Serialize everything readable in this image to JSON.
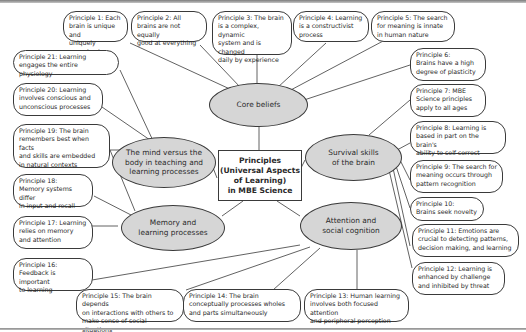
{
  "center": {
    "label": "Principles\n(Universal Aspects\nof Learning)\nin MBE Science"
  },
  "categories": [
    {
      "id": "core",
      "label": "Core beliefs"
    },
    {
      "id": "mind",
      "label": "The mind versus the\nbody in teaching and\nlearning processes"
    },
    {
      "id": "survival",
      "label": "Survival skills\nof the brain"
    },
    {
      "id": "memory",
      "label": "Memory and\nlearning processes"
    },
    {
      "id": "attention",
      "label": "Attention and\nsocial cognition"
    }
  ],
  "principles": [
    {
      "n": 1,
      "label": "Principle 1: Each\nbrain is unique and\nuniquely organized",
      "category": "core"
    },
    {
      "n": 2,
      "label": "Principle 2: All\nbrains are not equally\ngood at everything",
      "category": "core"
    },
    {
      "n": 3,
      "label": "Principle 3: The brain\nis a complex, dynamic\nsystem and is changed\ndaily by experience",
      "category": "core"
    },
    {
      "n": 4,
      "label": "Principle 4: Learning\nis a constructivist\nprocess",
      "category": "core"
    },
    {
      "n": 5,
      "label": "Principle 5: The search\nfor meaning is innate\nin human nature",
      "category": "core"
    },
    {
      "n": 6,
      "label": "Principle 6:\nBrains have a high\ndegree of plasticity",
      "category": "core"
    },
    {
      "n": 7,
      "label": "Principle 7: MBE\nScience principles\napply to all ages",
      "category": "survival"
    },
    {
      "n": 8,
      "label": "Principle 8: Learning is\nbased in part on the brain's\nability to self-correct",
      "category": "survival"
    },
    {
      "n": 9,
      "label": "Principle 9: The search for\nmeaning occurs through\npattern recognition",
      "category": "survival"
    },
    {
      "n": 10,
      "label": "Principle 10:\nBrains seek novelty",
      "category": "survival"
    },
    {
      "n": 11,
      "label": "Principle 11: Emotions are\ncrucial to detecting patterns,\ndecision making, and learning",
      "category": "survival"
    },
    {
      "n": 12,
      "label": "Principle 12: Learning is\nenhanced by challenge\nand inhibited by threat",
      "category": "survival"
    },
    {
      "n": 13,
      "label": "Principle 13: Human learning\ninvolves both focused attention\nand peripheral perception",
      "category": "attention"
    },
    {
      "n": 14,
      "label": "Principle 14: The brain\nconceptually processes wholes\nand parts simultaneously",
      "category": "attention"
    },
    {
      "n": 15,
      "label": "Principle 15: The brain depends\non interactions with others to\nmake sense of social situations",
      "category": "attention"
    },
    {
      "n": 16,
      "label": "Principle 16:\nFeedback is important\nto learning",
      "category": "attention"
    },
    {
      "n": 17,
      "label": "Principle 17: Learning\nrelies on memory\nand attention",
      "category": "memory"
    },
    {
      "n": 18,
      "label": "Principle 18:\nMemory systems differ\nin input and recall",
      "category": "memory"
    },
    {
      "n": 19,
      "label": "Principle 19: The brain\nremembers best when facts\nand skills are embedded\nin natural contexts",
      "category": "mind"
    },
    {
      "n": 20,
      "label": "Principle 20: Learning\ninvolves conscious and\nunconscious processes",
      "category": "mind"
    },
    {
      "n": 21,
      "label": "Principle 21: Learning\nengages the entire physiology",
      "category": "mind"
    }
  ],
  "colors": {
    "ellipse_fill": "#d6d6d6",
    "stroke": "#3a3a3a",
    "box_fill": "#ffffff"
  }
}
